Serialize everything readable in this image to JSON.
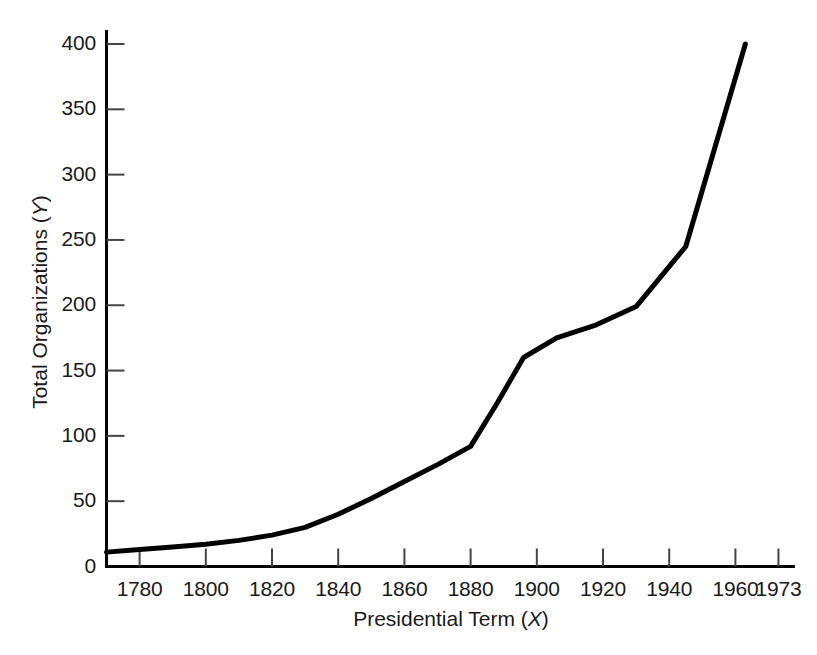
{
  "chart_data": {
    "type": "line",
    "title": "",
    "xlabel": "Presidential Term (X)",
    "xlabel_main": "Presidential Term (",
    "xlabel_var": "X",
    "xlabel_close": ")",
    "ylabel": "Total Organizations (Y)",
    "ylabel_main": "Total Organizations (",
    "ylabel_var": "Y",
    "ylabel_close": ")",
    "xlim": [
      1770,
      1978
    ],
    "ylim": [
      0,
      410
    ],
    "grid": false,
    "legend": false,
    "line_color": "#000000",
    "axis_color": "#000000",
    "xticks": [
      1780,
      1800,
      1820,
      1840,
      1860,
      1880,
      1900,
      1920,
      1940,
      1960,
      1973
    ],
    "xtick_labels": [
      "1780",
      "1800",
      "1820",
      "1840",
      "1860",
      "1880",
      "1900",
      "1920",
      "1940",
      "1960",
      "1973"
    ],
    "yticks": [
      0,
      50,
      100,
      150,
      200,
      250,
      300,
      350,
      400
    ],
    "ytick_labels": [
      "0",
      "50",
      "100",
      "150",
      "200",
      "250",
      "300",
      "350",
      "400"
    ],
    "x": [
      1770,
      1780,
      1790,
      1800,
      1810,
      1820,
      1830,
      1840,
      1850,
      1860,
      1870,
      1880,
      1888,
      1896,
      1906,
      1918,
      1930,
      1945,
      1963
    ],
    "values": [
      11,
      13,
      15,
      17,
      20,
      24,
      30,
      40,
      52,
      65,
      78,
      92,
      125,
      160,
      175,
      185,
      199,
      245,
      400
    ],
    "series": [
      {
        "name": "Total Organizations",
        "values": [
          11,
          13,
          15,
          17,
          20,
          24,
          30,
          40,
          52,
          65,
          78,
          92,
          125,
          160,
          175,
          185,
          199,
          245,
          400
        ]
      }
    ]
  }
}
